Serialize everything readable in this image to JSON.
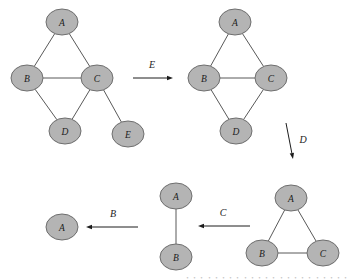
{
  "figure": {
    "background_color": "#ffffff",
    "node_fill": "#b4b4b4",
    "node_stroke": "#6e6e6e",
    "edge_color": "#595959",
    "arrow_color": "#1c1c1c"
  },
  "graphs": [
    {
      "id": "graph-1",
      "name": "initial-graph",
      "nodes": [
        {
          "id": "A",
          "label": "A",
          "cx": 62,
          "cy": 22
        },
        {
          "id": "B",
          "label": "B",
          "cx": 27,
          "cy": 78
        },
        {
          "id": "C",
          "label": "C",
          "cx": 97,
          "cy": 78
        },
        {
          "id": "D",
          "label": "D",
          "cx": 65,
          "cy": 131
        },
        {
          "id": "E",
          "label": "E",
          "cx": 128,
          "cy": 134
        }
      ],
      "edges": [
        {
          "from": "A",
          "to": "B"
        },
        {
          "from": "A",
          "to": "C"
        },
        {
          "from": "B",
          "to": "C"
        },
        {
          "from": "B",
          "to": "D"
        },
        {
          "from": "C",
          "to": "D"
        },
        {
          "from": "C",
          "to": "E"
        }
      ]
    },
    {
      "id": "graph-2",
      "name": "graph-after-eliminating-E",
      "nodes": [
        {
          "id": "A",
          "label": "A",
          "cx": 235,
          "cy": 22
        },
        {
          "id": "B",
          "label": "B",
          "cx": 204,
          "cy": 78
        },
        {
          "id": "C",
          "label": "C",
          "cx": 271,
          "cy": 78
        },
        {
          "id": "D",
          "label": "D",
          "cx": 236,
          "cy": 131
        }
      ],
      "edges": [
        {
          "from": "A",
          "to": "B"
        },
        {
          "from": "A",
          "to": "C"
        },
        {
          "from": "B",
          "to": "C"
        },
        {
          "from": "B",
          "to": "D"
        },
        {
          "from": "C",
          "to": "D"
        }
      ]
    },
    {
      "id": "graph-3",
      "name": "graph-after-eliminating-D",
      "nodes": [
        {
          "id": "A",
          "label": "A",
          "cx": 291,
          "cy": 198
        },
        {
          "id": "B",
          "label": "B",
          "cx": 262,
          "cy": 253
        },
        {
          "id": "C",
          "label": "C",
          "cx": 323,
          "cy": 253
        }
      ],
      "edges": [
        {
          "from": "A",
          "to": "B"
        },
        {
          "from": "A",
          "to": "C"
        },
        {
          "from": "B",
          "to": "C"
        }
      ]
    },
    {
      "id": "graph-4",
      "name": "graph-after-eliminating-C",
      "nodes": [
        {
          "id": "A",
          "label": "A",
          "cx": 176,
          "cy": 196
        },
        {
          "id": "B",
          "label": "B",
          "cx": 176,
          "cy": 257
        }
      ],
      "edges": [
        {
          "from": "A",
          "to": "B"
        }
      ]
    },
    {
      "id": "graph-5",
      "name": "graph-after-eliminating-B",
      "nodes": [
        {
          "id": "A",
          "label": "A",
          "cx": 62,
          "cy": 227
        }
      ],
      "edges": []
    }
  ],
  "arrows": [
    {
      "id": "arrow-E",
      "name": "eliminate-E-arrow",
      "label": "E",
      "x1": 133,
      "y1": 78,
      "x2": 173,
      "y2": 78,
      "label_x": 152,
      "label_y": 68,
      "direction": "right"
    },
    {
      "id": "arrow-D",
      "name": "eliminate-D-arrow",
      "label": "D",
      "x1": 286,
      "y1": 123,
      "x2": 293,
      "y2": 159,
      "label_x": 303,
      "label_y": 143,
      "direction": "down-right"
    },
    {
      "id": "arrow-C",
      "name": "eliminate-C-arrow",
      "label": "C",
      "x1": 250,
      "y1": 226,
      "x2": 198,
      "y2": 226,
      "label_x": 223,
      "label_y": 216,
      "direction": "left"
    },
    {
      "id": "arrow-B",
      "name": "eliminate-B-arrow",
      "label": "B",
      "x1": 138,
      "y1": 227,
      "x2": 86,
      "y2": 227,
      "label_x": 113,
      "label_y": 217,
      "direction": "left"
    }
  ],
  "node_geometry": {
    "rx": 16,
    "ry": 13
  },
  "caption": {
    "text": "・・・・・・・・・・・・・・・・・・・・・・・・・・・・"
  }
}
